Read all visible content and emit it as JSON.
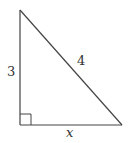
{
  "diagram": {
    "type": "right-triangle",
    "stroke_color": "#444444",
    "label_color": "#333333",
    "vertices": {
      "top": [
        20,
        10
      ],
      "bottom_left": [
        20,
        125
      ],
      "bottom_right": [
        122,
        125
      ]
    },
    "right_angle_marker": {
      "corner": "bottom_left",
      "size": 11
    },
    "labels": {
      "left_side": "3",
      "hypotenuse": "4",
      "bottom_side": "x"
    }
  }
}
